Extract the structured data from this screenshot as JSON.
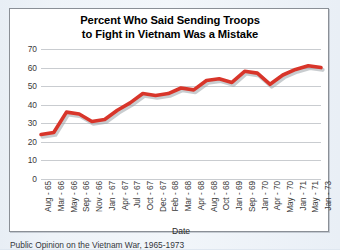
{
  "page": {
    "background_color": "#eef3f8",
    "panel_border_color": "#8a8f96",
    "caption": "Public Opinion on the Vietnam War, 1965-1973"
  },
  "chart_data": {
    "type": "line",
    "title": "Percent Who Said Sending Troops to Fight in Vietnam Was a Mistake",
    "title_line_1": "Percent Who Said Sending Troops",
    "title_line_2": "to Fight in Vietnam Was a Mistake",
    "xlabel": "Date",
    "ylabel": "",
    "ylim": [
      0,
      70
    ],
    "yticks": [
      0,
      10,
      20,
      30,
      40,
      50,
      60,
      70
    ],
    "grid": true,
    "legend": "none",
    "line_color": "#d8352a",
    "shadow_color": "#9aa3a8",
    "categories": [
      "Aug - 65",
      "Mar - 66",
      "May - 66",
      "Sep - 66",
      "Nov - 66",
      "Jan - 67",
      "Apr - 67",
      "Jul - 67",
      "Oct - 67",
      "Dec - 67",
      "Feb - 68",
      "Mar - 68",
      "Apr - 68",
      "Aug - 68",
      "Oct - 68",
      "Jan - 69",
      "Sep - 69",
      "Jan - 70",
      "Apr - 70",
      "May - 70",
      "Jan - 71",
      "May - 71",
      "Jan - 73"
    ],
    "values": [
      24,
      25,
      36,
      35,
      31,
      32,
      37,
      41,
      46,
      45,
      46,
      49,
      48,
      53,
      54,
      52,
      58,
      57,
      51,
      56,
      59,
      61,
      60
    ]
  }
}
